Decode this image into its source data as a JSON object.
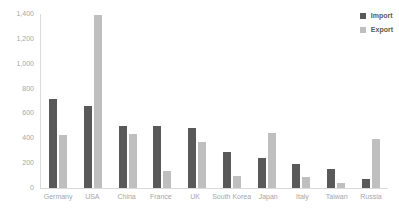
{
  "chart_data": {
    "type": "bar",
    "title": "",
    "xlabel": "",
    "ylabel": "",
    "categories": [
      "Germany",
      "USA",
      "China",
      "France",
      "UK",
      "South Korea",
      "Japan",
      "Italy",
      "Taiwan",
      "Russia"
    ],
    "series": [
      {
        "name": "Import",
        "color": "#595959",
        "values": [
          720,
          660,
          500,
          495,
          480,
          290,
          240,
          195,
          155,
          70
        ]
      },
      {
        "name": "Export",
        "color": "#bfbfbf",
        "values": [
          425,
          1390,
          435,
          140,
          370,
          100,
          445,
          85,
          40,
          395
        ]
      }
    ],
    "ylim": [
      0,
      1400
    ],
    "yticks": [
      0,
      200,
      400,
      600,
      800,
      1000,
      1200,
      1400
    ],
    "ytick_labels": [
      "0",
      "200",
      "400",
      "600",
      "800",
      "1,000",
      "1,200",
      "1,400"
    ],
    "grid": false,
    "legend_position": "top-right",
    "y_axis_title": ""
  },
  "legend": {
    "items": [
      {
        "label": "Import",
        "color": "#595959"
      },
      {
        "label": "Export",
        "color": "#bfbfbf"
      }
    ]
  }
}
